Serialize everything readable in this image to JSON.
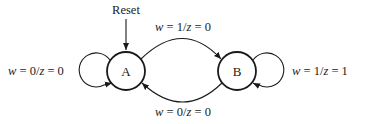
{
  "diagram": {
    "type": "finite-state-machine",
    "states": [
      {
        "id": "A",
        "label": "A",
        "initial": true
      },
      {
        "id": "B",
        "label": "B",
        "initial": false
      }
    ],
    "reset_label": "Reset",
    "transitions": [
      {
        "from": "A",
        "to": "A",
        "input_var": "w",
        "input": "0",
        "output_var": "z",
        "output": "0",
        "label": "w = 0/z = 0"
      },
      {
        "from": "A",
        "to": "B",
        "input_var": "w",
        "input": "1",
        "output_var": "z",
        "output": "0",
        "label": "w = 1/z = 0"
      },
      {
        "from": "B",
        "to": "B",
        "input_var": "w",
        "input": "1",
        "output_var": "z",
        "output": "1",
        "label": "w = 1/z = 1"
      },
      {
        "from": "B",
        "to": "A",
        "input_var": "w",
        "input": "0",
        "output_var": "z",
        "output": "0",
        "label": "w = 0/z = 0"
      }
    ],
    "labels": {
      "self_a": {
        "pre": "w",
        "mid": " = 0/",
        "var": "z",
        "post": " = 0"
      },
      "a_to_b": {
        "pre": "w",
        "mid": " = 1/",
        "var": "z",
        "post": " = 0"
      },
      "self_b": {
        "pre": "w",
        "mid": " = 1/",
        "var": "z",
        "post": " = 1"
      },
      "b_to_a": {
        "pre": "w",
        "mid": " = 0/",
        "var": "z",
        "post": " = 0"
      }
    }
  }
}
